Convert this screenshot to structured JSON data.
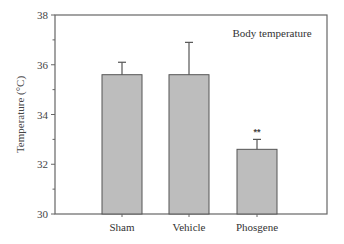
{
  "chart_data": {
    "type": "bar",
    "title": "Body temperature",
    "xlabel": "",
    "ylabel": "Temperature (°C)",
    "ylim": [
      30,
      38
    ],
    "yticks": [
      30,
      32,
      34,
      36,
      38
    ],
    "categories": [
      "Sham",
      "Vehicle",
      "Phosgene"
    ],
    "values": [
      35.6,
      35.6,
      32.6
    ],
    "error_upper": [
      0.5,
      1.3,
      0.4
    ],
    "annotations": [
      {
        "category": "Phosgene",
        "text": "**"
      }
    ],
    "grid": false,
    "legend": null,
    "bar_color": "#bdbdbd",
    "edge_color": "#555555"
  }
}
